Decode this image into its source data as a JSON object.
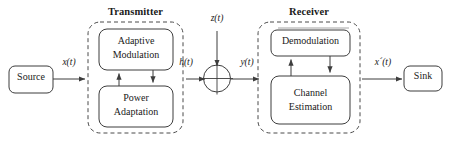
{
  "diagram": {
    "type": "block-diagram",
    "stroke_color": "#3d3d3d",
    "text_color": "#1a1a1a",
    "background": "#ffffff"
  },
  "groups": [
    {
      "id": "transmitter",
      "label": "Transmitter",
      "style": "dashed-rounded"
    },
    {
      "id": "receiver",
      "label": "Receiver",
      "style": "dashed-rounded"
    }
  ],
  "blocks": [
    {
      "id": "source",
      "label": "Source",
      "lines": [
        "Source"
      ]
    },
    {
      "id": "adaptive-modulation",
      "label": "Adaptive Modulation",
      "lines": [
        "Adaptive",
        "Modulation"
      ]
    },
    {
      "id": "power-adaptation",
      "label": "Power Adaptation",
      "lines": [
        "Power",
        "Adaptation"
      ]
    },
    {
      "id": "demodulation",
      "label": "Demodulation",
      "lines": [
        "Demodulation"
      ]
    },
    {
      "id": "channel-estimation",
      "label": "Channel Estimation",
      "lines": [
        "Channel",
        "Estimation"
      ]
    },
    {
      "id": "sink",
      "label": "Sink",
      "lines": [
        "Sink"
      ]
    }
  ],
  "junction": {
    "id": "summing-junction",
    "symbol": "cross-circle"
  },
  "signals": {
    "x_t": {
      "text": "x(t)",
      "italic_part": "x",
      "desc": "source output signal"
    },
    "h_t": {
      "text": "h(t)",
      "italic_part": "h",
      "desc": "channel gain signal"
    },
    "z_t": {
      "text": "z(t)",
      "italic_part": "z",
      "desc": "additive noise"
    },
    "y_t": {
      "text": "y(t)",
      "italic_part": "y",
      "desc": "received signal"
    },
    "x_prime_t": {
      "text": "x´(t)",
      "italic_part": "x´",
      "desc": "recovered signal"
    }
  },
  "connections": [
    {
      "from": "source",
      "to": "transmitter",
      "label": "x(t)",
      "arrow": true
    },
    {
      "from": "power-adaptation",
      "to": "adaptive-modulation",
      "label": "",
      "arrow": true,
      "direction": "up"
    },
    {
      "from": "adaptive-modulation",
      "to": "power-adaptation",
      "label": "",
      "arrow": true,
      "direction": "down"
    },
    {
      "from": "transmitter",
      "to": "summing-junction",
      "label": "h(t)",
      "arrow": true
    },
    {
      "from": "noise",
      "to": "summing-junction",
      "label": "z(t)",
      "arrow": true,
      "direction": "down"
    },
    {
      "from": "summing-junction",
      "to": "receiver",
      "label": "y(t)",
      "arrow": true
    },
    {
      "from": "channel-estimation",
      "to": "demodulation",
      "label": "",
      "arrow": true,
      "direction": "up"
    },
    {
      "from": "demodulation",
      "to": "channel-estimation",
      "label": "",
      "arrow": true,
      "direction": "down"
    },
    {
      "from": "receiver",
      "to": "sink",
      "label": "x´(t)",
      "arrow": true
    }
  ]
}
